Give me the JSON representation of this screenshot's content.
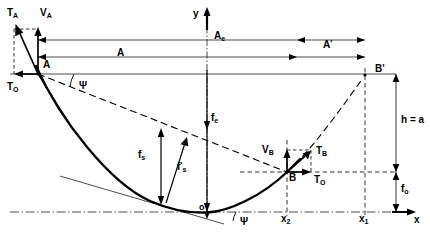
{
  "figure": {
    "type": "engineering-diagram",
    "background_color": "#ffffff",
    "ink_color": "#000000"
  },
  "axes": {
    "x_axis_label": "x",
    "y_axis_label": "y",
    "origin_label": "o",
    "x_tick_labels": [
      {
        "name": "x2",
        "text": "x",
        "sub": "2"
      },
      {
        "name": "x1",
        "text": "x",
        "sub": "1"
      }
    ]
  },
  "points": {
    "A": "A",
    "B": "B",
    "B_prime": "B'",
    "origin": "o"
  },
  "forces": {
    "tension_A": {
      "text": "T",
      "sub": "A"
    },
    "vertical_A": {
      "text": "V",
      "sub": "A"
    },
    "horizontal_A": {
      "text": "T",
      "sub": "O"
    },
    "tension_B": {
      "text": "T",
      "sub": "B"
    },
    "vertical_B": {
      "text": "V",
      "sub": "B"
    },
    "horizontal_B": {
      "text": "T",
      "sub": "O"
    }
  },
  "dimensions": {
    "span_A": {
      "text": "A",
      "sub": ""
    },
    "span_Ae": {
      "text": "A",
      "sub": "e"
    },
    "span_A_prime": {
      "text": "A",
      "prime": "'"
    },
    "height_h": "h = a",
    "sag_f_s": {
      "text": "f",
      "sub": "s"
    },
    "sag_f_s_prime": {
      "text": "f",
      "sub": "s",
      "prime": "'"
    },
    "sag_f_e": {
      "text": "f",
      "sub": "e"
    },
    "offset_f_o": {
      "text": "f",
      "sub": "o"
    }
  },
  "angles": {
    "psi_at_A": "Ψ",
    "psi_at_origin": "Ψ"
  }
}
